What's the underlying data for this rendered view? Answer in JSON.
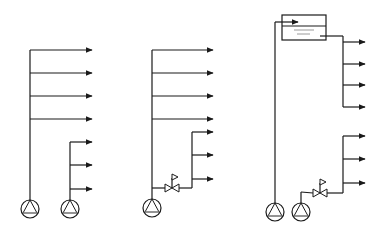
{
  "diagram": {
    "type": "hydraulic-schematic",
    "colors": {
      "line": "#1a1a1a",
      "accent_gray": "#9a9a9a",
      "background": "#ffffff"
    },
    "systems": [
      {
        "id": "two-pump-direct",
        "pumps": [
          {
            "cx": 30,
            "cy": 209
          },
          {
            "cx": 70,
            "cy": 209
          }
        ],
        "risers": [
          {
            "x": 30,
            "y_top": 50,
            "y_bottom": 200,
            "branches_y": [
              50,
              73,
              96,
              119
            ],
            "x_end": 92
          },
          {
            "x": 70,
            "y_top": 142,
            "y_bottom": 200,
            "branches_y": [
              142,
              165,
              189
            ],
            "x_end": 92
          }
        ]
      },
      {
        "id": "single-pump-with-pressure-reducing-valve",
        "pumps": [
          {
            "cx": 152,
            "cy": 208
          }
        ],
        "risers": [
          {
            "x": 152,
            "y_top": 50,
            "y_bottom": 199,
            "branches_y": [
              50,
              73,
              96,
              119
            ],
            "x_end": 213
          },
          {
            "x": 192,
            "y_top": 132,
            "y_bottom": 188,
            "branches_y": [
              132,
              155,
              179
            ],
            "x_end": 213
          }
        ],
        "valve": {
          "cx": 172,
          "cy": 188,
          "feed_from_x": 152
        }
      },
      {
        "id": "roof-tank-with-pressure-reducing-valve",
        "pumps": [
          {
            "cx": 275,
            "cy": 212
          },
          {
            "cx": 301,
            "cy": 212
          }
        ],
        "tank": {
          "x": 282,
          "y": 15,
          "w": 44,
          "h": 25,
          "water_y": 26,
          "inlet_y": 22,
          "outlet_y": 36
        },
        "tank_feed_riser_x": 275,
        "risers": [
          {
            "x": 343,
            "y_top": 36,
            "y_bottom": 107,
            "branches_y": [
              42,
              64,
              85,
              107
            ],
            "x_end": 365
          },
          {
            "x": 343,
            "y_top": 136,
            "y_bottom": 193,
            "branches_y": [
              136,
              159,
              183
            ],
            "x_end": 365
          }
        ],
        "valve": {
          "cx": 320,
          "cy": 193,
          "feed_from_x": 301
        }
      }
    ]
  }
}
